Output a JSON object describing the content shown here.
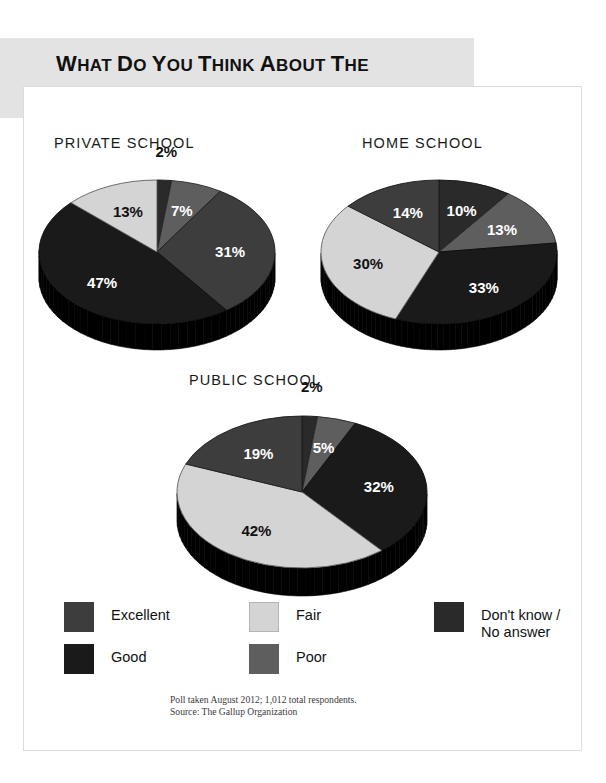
{
  "title": {
    "line1": "What Do You Think About the",
    "line2": "Quality of Education Provided?"
  },
  "source": {
    "line1": "Poll taken August 2012; 1,012 total respondents.",
    "line2": "Source: The Gallup Organization"
  },
  "legend": {
    "items": [
      {
        "label": "Excellent",
        "color": "#3d3d3d"
      },
      {
        "label": "Good",
        "color": "#1a1a1a"
      },
      {
        "label": "Fair",
        "color": "#d4d4d4"
      },
      {
        "label": "Poor",
        "color": "#5e5e5e"
      },
      {
        "label": "Don't know /\nNo answer",
        "color": "#2a2a2a"
      }
    ]
  },
  "chart_data": {
    "type": "pie",
    "title": "What Do You Think About the Quality of Education Provided?",
    "categories": [
      "Excellent",
      "Good",
      "Fair",
      "Poor",
      "Don't know / No answer"
    ],
    "colors": [
      "#3d3d3d",
      "#1a1a1a",
      "#d4d4d4",
      "#5e5e5e",
      "#2a2a2a"
    ],
    "units": "percent",
    "legend_position": "bottom",
    "grid": false,
    "annotations": [
      "Poll taken August 2012; 1,012 total respondents.",
      "Source: The Gallup Organization"
    ],
    "charts": [
      {
        "name": "PRIVATE SCHOOL",
        "values": [
          31,
          47,
          13,
          7,
          2
        ],
        "labels": [
          "31%",
          "47%",
          "13%",
          "7%",
          "2%"
        ],
        "slices": [
          {
            "category": "Don't know / No answer",
            "value": 2,
            "label": "2%",
            "color": "#2a2a2a"
          },
          {
            "category": "Poor",
            "value": 7,
            "label": "7%",
            "color": "#5e5e5e"
          },
          {
            "category": "Excellent",
            "value": 31,
            "label": "31%",
            "color": "#3d3d3d"
          },
          {
            "category": "Good",
            "value": 47,
            "label": "47%",
            "color": "#1a1a1a"
          },
          {
            "category": "Fair",
            "value": 13,
            "label": "13%",
            "color": "#d4d4d4"
          }
        ]
      },
      {
        "name": "HOME SCHOOL",
        "values": [
          14,
          33,
          30,
          13,
          10
        ],
        "labels": [
          "14%",
          "33%",
          "30%",
          "13%",
          "10%"
        ],
        "slices": [
          {
            "category": "Don't know / No answer",
            "value": 10,
            "label": "10%",
            "color": "#2a2a2a"
          },
          {
            "category": "Poor",
            "value": 13,
            "label": "13%",
            "color": "#5e5e5e"
          },
          {
            "category": "Good",
            "value": 33,
            "label": "33%",
            "color": "#1a1a1a"
          },
          {
            "category": "Fair",
            "value": 30,
            "label": "30%",
            "color": "#d4d4d4"
          },
          {
            "category": "Excellent",
            "value": 14,
            "label": "14%",
            "color": "#3d3d3d"
          }
        ]
      },
      {
        "name": "PUBLIC SCHOOL",
        "values": [
          19,
          32,
          42,
          5,
          2
        ],
        "labels": [
          "19%",
          "32%",
          "42%",
          "5%",
          "2%"
        ],
        "slices": [
          {
            "category": "Don't know / No answer",
            "value": 2,
            "label": "2%",
            "color": "#2a2a2a"
          },
          {
            "category": "Poor",
            "value": 5,
            "label": "5%",
            "color": "#5e5e5e"
          },
          {
            "category": "Good",
            "value": 32,
            "label": "32%",
            "color": "#1a1a1a"
          },
          {
            "category": "Fair",
            "value": 42,
            "label": "42%",
            "color": "#d4d4d4"
          },
          {
            "category": "Excellent",
            "value": 19,
            "label": "19%",
            "color": "#3d3d3d"
          }
        ]
      }
    ]
  }
}
